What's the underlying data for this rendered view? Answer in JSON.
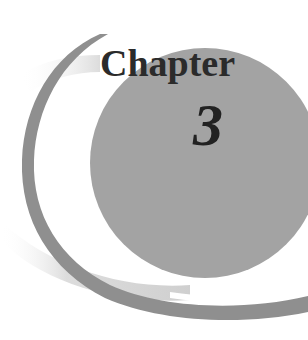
{
  "chapter": {
    "label": "Chapter",
    "number": "3"
  },
  "colors": {
    "disc": "#a3a3a3",
    "arc": "#8f8f8f",
    "shadow": "#d6d6d6",
    "text": "#2b2b2b",
    "background": "#ffffff"
  }
}
